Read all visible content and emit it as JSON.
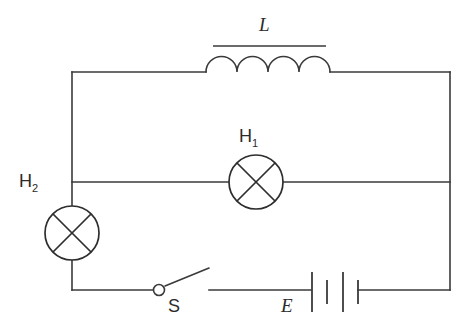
{
  "diagram": {
    "background_color": "#ffffff",
    "line_color": "#3a3a3a",
    "text_color": "#2b2b2b",
    "width": 468,
    "height": 331
  },
  "labels": {
    "inductor": "L",
    "lamp_1_letter": "H",
    "lamp_1_sub": "1",
    "lamp_2_letter": "H",
    "lamp_2_sub": "2",
    "switch": "S",
    "battery": "E"
  },
  "components": [
    {
      "name": "inductor",
      "symbol": "coil-with-core",
      "label": "L",
      "coil_arcs": 4,
      "position": {
        "x": 267,
        "y": 72
      },
      "branch": "top"
    },
    {
      "name": "lamp-h1",
      "symbol": "lamp-circle-cross",
      "label": "H1",
      "position": {
        "x": 256,
        "y": 182
      },
      "radius": 27,
      "branch": "middle"
    },
    {
      "name": "lamp-h2",
      "symbol": "lamp-circle-cross",
      "label": "H2",
      "position": {
        "x": 72,
        "y": 233
      },
      "radius": 27,
      "branch": "left"
    },
    {
      "name": "switch",
      "symbol": "spst-switch-open",
      "label": "S",
      "state": "open",
      "position": {
        "x": 160,
        "y": 290
      },
      "branch": "bottom"
    },
    {
      "name": "battery",
      "symbol": "battery-two-cell",
      "label": "E",
      "plate_count": 4,
      "position": {
        "x": 330,
        "y": 290
      },
      "branch": "bottom"
    }
  ],
  "nodes": {
    "top_left": {
      "x": 72,
      "y": 72
    },
    "top_right": {
      "x": 450,
      "y": 72
    },
    "mid_left": {
      "x": 72,
      "y": 182
    },
    "mid_right": {
      "x": 450,
      "y": 182
    },
    "bottom_left": {
      "x": 72,
      "y": 290
    },
    "bottom_right": {
      "x": 450,
      "y": 290
    }
  }
}
